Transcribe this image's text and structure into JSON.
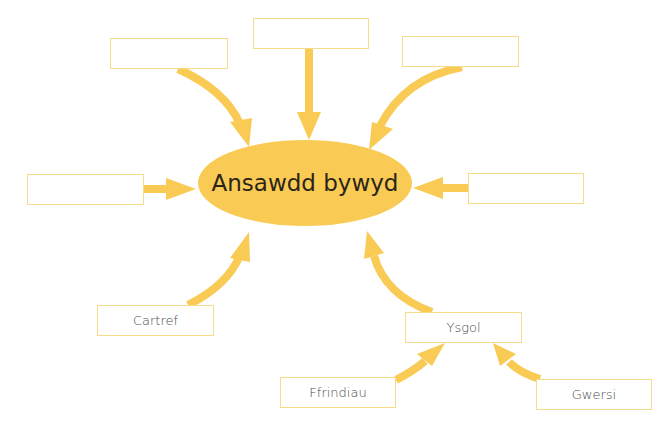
{
  "diagram": {
    "title": "Ansawdd bywyd",
    "accent_color": "#F9CB55",
    "box_border_color": "#F6DC8A",
    "boxes": [
      {
        "id": "top-left",
        "label": "",
        "x": 110,
        "y": 38,
        "w": 118,
        "h": 31
      },
      {
        "id": "top-center",
        "label": "",
        "x": 253,
        "y": 18,
        "w": 116,
        "h": 31
      },
      {
        "id": "top-right",
        "label": "",
        "x": 402,
        "y": 36,
        "w": 117,
        "h": 31
      },
      {
        "id": "left",
        "label": "",
        "x": 27,
        "y": 174,
        "w": 117,
        "h": 31
      },
      {
        "id": "right",
        "label": "",
        "x": 468,
        "y": 173,
        "w": 116,
        "h": 31
      },
      {
        "id": "cartref",
        "label": "Cartref",
        "x": 97,
        "y": 305,
        "w": 117,
        "h": 31
      },
      {
        "id": "ysgol",
        "label": "Ysgol",
        "x": 405,
        "y": 312,
        "w": 117,
        "h": 31
      },
      {
        "id": "ffrindiau",
        "label": "Ffrindiau",
        "x": 280,
        "y": 377,
        "w": 116,
        "h": 31
      },
      {
        "id": "gwersi",
        "label": "Gwersi",
        "x": 536,
        "y": 379,
        "w": 116,
        "h": 31
      }
    ],
    "connections": [
      {
        "from": "top-left",
        "to": "Ansawdd bywyd"
      },
      {
        "from": "top-center",
        "to": "Ansawdd bywyd"
      },
      {
        "from": "top-right",
        "to": "Ansawdd bywyd"
      },
      {
        "from": "left",
        "to": "Ansawdd bywyd"
      },
      {
        "from": "right",
        "to": "Ansawdd bywyd"
      },
      {
        "from": "Cartref",
        "to": "Ansawdd bywyd"
      },
      {
        "from": "Ysgol",
        "to": "Ansawdd bywyd"
      },
      {
        "from": "Ffrindiau",
        "to": "Ysgol"
      },
      {
        "from": "Gwersi",
        "to": "Ysgol"
      }
    ]
  }
}
